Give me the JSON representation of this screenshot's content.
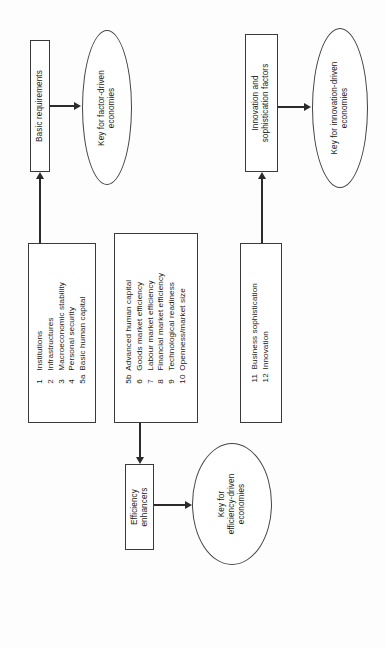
{
  "diagram": {
    "orientation": "rotated-90-ccw",
    "stage_boxes": [
      {
        "id": "basic-requirements",
        "label": "Basic requirements"
      },
      {
        "id": "efficiency-enhancers",
        "label": "Efficiency\nenhancers",
        "line1": "Efficiency",
        "line2": "enhancers"
      },
      {
        "id": "innovation-sophistication",
        "label": "Innovation and\nsophistication factors",
        "line1": "Innovation and",
        "line2": "sophistication factors"
      }
    ],
    "key_ellipses": [
      {
        "id": "key-factor-driven",
        "line1": "Key for factor-driven",
        "line2": "economies"
      },
      {
        "id": "key-efficiency-driven",
        "line1": "Key for",
        "line2": "efficiency-driven",
        "line3": "economies"
      },
      {
        "id": "key-innovation-driven",
        "line1": "Key for innovation-driven",
        "line2": "economies"
      }
    ],
    "pillar_groups": [
      {
        "id": "basic-requirements-pillars",
        "items": [
          {
            "num": "1",
            "label": "Institutions"
          },
          {
            "num": "2",
            "label": "Infrastructures"
          },
          {
            "num": "3",
            "label": "Macroeconomic stability"
          },
          {
            "num": "4",
            "label": "Personal security"
          },
          {
            "num": "5a",
            "label": "Basic human capital"
          }
        ]
      },
      {
        "id": "efficiency-enhancers-pillars",
        "items": [
          {
            "num": "5b",
            "label": "Advanced human capital"
          },
          {
            "num": "6",
            "label": "Goods market efficiency"
          },
          {
            "num": "7",
            "label": "Labour market efficiency"
          },
          {
            "num": "8",
            "label": "Financial market efficiency"
          },
          {
            "num": "9",
            "label": "Technological readiness"
          },
          {
            "num": "10",
            "label": "Openness/market size"
          }
        ]
      },
      {
        "id": "innovation-sophistication-pillars",
        "items": [
          {
            "num": "11",
            "label": "Business sophistication"
          },
          {
            "num": "12",
            "label": "Innovation"
          }
        ]
      }
    ],
    "colors": {
      "stroke": "#3a3a3a",
      "connector": "#2b2b2b",
      "background": "#fdfdfd",
      "text": "#1a1a1a"
    }
  }
}
